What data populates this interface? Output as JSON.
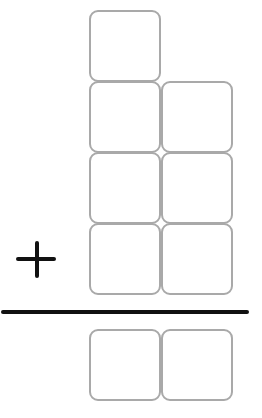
{
  "diagram": {
    "type": "vertical-addition-place-value-boxes",
    "operator": "+",
    "addend_rows": [
      {
        "boxes": 1,
        "columns": [
          "tens"
        ]
      },
      {
        "boxes": 2,
        "columns": [
          "tens",
          "ones"
        ]
      },
      {
        "boxes": 2,
        "columns": [
          "tens",
          "ones"
        ]
      },
      {
        "boxes": 2,
        "columns": [
          "tens",
          "ones"
        ]
      }
    ],
    "answer_row": {
      "boxes": 2,
      "columns": [
        "tens",
        "ones"
      ]
    },
    "colors": {
      "box_border": "#a9a9a9",
      "operator": "#111111",
      "rule": "#111111",
      "background": "#ffffff"
    }
  }
}
